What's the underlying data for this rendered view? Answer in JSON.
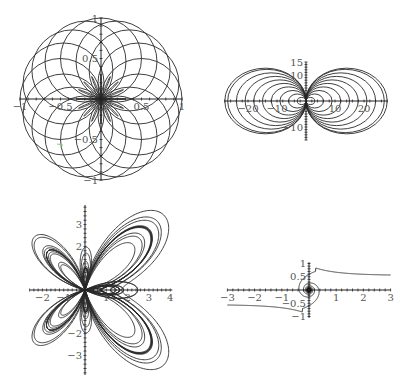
{
  "figure": {
    "background": "#ffffff",
    "line_color": "#2a2a2a",
    "artifact_color": "#7fd17f"
  },
  "chart_data": [
    {
      "id": "plot-circles-rose",
      "type": "line",
      "title": "",
      "description": "Family of circles of radius 0.5 through the origin, centers on a circle of radius 0.5",
      "xlabel": "",
      "ylabel": "",
      "xlim": [
        -1,
        1
      ],
      "ylim": [
        -1,
        1
      ],
      "x_tick_labels": [
        "-1",
        "-0.5",
        "0.5",
        "1"
      ],
      "y_tick_labels": [
        "1",
        "0.5",
        "-0.5",
        "-1"
      ],
      "grid": false,
      "legend": null,
      "series": [
        {
          "name": "circles",
          "count": 16,
          "radius": 0.5
        }
      ],
      "frame": {
        "cx": 101,
        "cy": 99,
        "sx": 81,
        "sy": 81
      }
    },
    {
      "id": "plot-tangent-circles",
      "type": "line",
      "title": "",
      "description": "Nested circles tangent to the y-axis at the origin, on both sides",
      "xlabel": "",
      "ylabel": "",
      "xlim": [
        -28,
        28
      ],
      "ylim": [
        -15,
        15
      ],
      "x_tick_labels": [
        "-20",
        "-10",
        "10",
        "20"
      ],
      "y_tick_labels": [
        "15",
        "10",
        "-10"
      ],
      "grid": false,
      "legend": null,
      "series": [
        {
          "name": "circles",
          "radii": [
            1.5,
            3,
            4.5,
            6,
            7.5,
            9,
            10.5,
            12,
            13.5,
            14
          ]
        }
      ],
      "frame": {
        "cx": 306,
        "cy": 101,
        "sx": 2.9,
        "sy": 2.6
      }
    },
    {
      "id": "plot-butterfly",
      "type": "line",
      "title": "",
      "description": "Butterfly curve r = e^cos(t) - 2cos(4t) - sin^5(t/12)",
      "xlabel": "",
      "ylabel": "",
      "xlim": [
        -2.5,
        4
      ],
      "ylim": [
        -3.8,
        3.8
      ],
      "x_tick_labels": [
        "-2",
        "-1",
        "1",
        "2",
        "3",
        "4"
      ],
      "y_tick_labels": [
        "3",
        "2",
        "-2",
        "-3"
      ],
      "grid": false,
      "legend": null,
      "series": [
        {
          "name": "butterfly",
          "t_range": [
            0,
            75.4
          ]
        }
      ],
      "frame": {
        "cx": 85,
        "cy": 290,
        "sx": 21.3,
        "sy": 21.8
      }
    },
    {
      "id": "plot-spiral",
      "type": "line",
      "title": "",
      "description": "Spiral winding into the origin with asymptotic tails toward y = ±0.55",
      "xlabel": "",
      "ylabel": "",
      "xlim": [
        -3,
        3
      ],
      "ylim": [
        -1,
        1
      ],
      "x_tick_labels": [
        "-3",
        "-2",
        "-1",
        "1",
        "2",
        "3"
      ],
      "y_tick_labels": [
        "1",
        "0.5",
        "-0.5",
        "-1"
      ],
      "grid": false,
      "legend": null,
      "series": [
        {
          "name": "spiral",
          "t_range": [
            0.35,
            40
          ]
        }
      ],
      "frame": {
        "cx": 309,
        "cy": 290,
        "sx": 27.2,
        "sy": 26.5
      }
    }
  ]
}
